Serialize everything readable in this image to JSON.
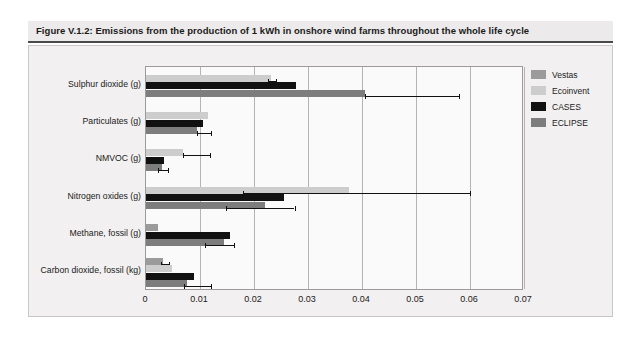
{
  "figure": {
    "caption": "Figure V.1.2: Emissions from the production of 1 kWh in onshore wind farms throughout the whole life cycle"
  },
  "legend": {
    "position": "top-right",
    "entries": [
      {
        "label": "Vestas",
        "color": "#9b9b9b"
      },
      {
        "label": "Ecoinvent",
        "color": "#cdcdcd"
      },
      {
        "label": "CASES",
        "color": "#111111"
      },
      {
        "label": "ECLIPSE",
        "color": "#7d7d7d"
      }
    ]
  },
  "chart_data": {
    "type": "bar",
    "orientation": "horizontal",
    "title": "Emissions from the production of 1 kWh in onshore wind farms throughout the whole life cycle",
    "xlabel": "",
    "ylabel": "",
    "xlim": [
      0,
      0.07
    ],
    "xticks": [
      "0",
      "0.01",
      "0.02",
      "0.03",
      "0.04",
      "0.05",
      "0.06",
      "0.07"
    ],
    "xtick_values": [
      0,
      0.01,
      0.02,
      0.03,
      0.04,
      0.05,
      0.06,
      0.07
    ],
    "grid": "vertical",
    "categories": [
      "Sulphur dioxide (g)",
      "Particulates (g)",
      "NMVOC (g)",
      "Nitrogen oxides (g)",
      "Methane, fossil (g)",
      "Carbon dioxide, fossil (kg)"
    ],
    "series": [
      {
        "name": "Vestas",
        "color": "#9b9b9b",
        "values": [
          null,
          null,
          null,
          null,
          0.0022,
          0.0032
        ]
      },
      {
        "name": "Ecoinvent",
        "color": "#cdcdcd",
        "values": [
          0.0232,
          0.0115,
          0.0068,
          0.0375,
          null,
          0.0048
        ]
      },
      {
        "name": "CASES",
        "color": "#111111",
        "values": [
          0.0277,
          0.0105,
          0.0034,
          0.0255,
          0.0155,
          0.0088
        ]
      },
      {
        "name": "ECLIPSE",
        "color": "#7d7d7d",
        "values": [
          0.0405,
          0.0095,
          0.003,
          0.022,
          0.0145,
          0.0075
        ]
      }
    ],
    "error_bars": [
      {
        "category": "Sulphur dioxide (g)",
        "series": "Ecoinvent",
        "center": 0.0232,
        "low": 0.0225,
        "high": 0.024
      },
      {
        "category": "Sulphur dioxide (g)",
        "series": "ECLIPSE",
        "center": 0.0405,
        "low": 0.0405,
        "high": 0.058
      },
      {
        "category": "Particulates (g)",
        "series": "ECLIPSE",
        "center": 0.0095,
        "low": 0.0095,
        "high": 0.012
      },
      {
        "category": "NMVOC (g)",
        "series": "Ecoinvent",
        "center": 0.0068,
        "low": 0.0068,
        "high": 0.0118
      },
      {
        "category": "NMVOC (g)",
        "series": "ECLIPSE",
        "center": 0.003,
        "low": 0.0022,
        "high": 0.004
      },
      {
        "category": "Nitrogen oxides (g)",
        "series": "Ecoinvent",
        "center": 0.0375,
        "low": 0.018,
        "high": 0.06
      },
      {
        "category": "Nitrogen oxides (g)",
        "series": "ECLIPSE",
        "center": 0.022,
        "low": 0.0148,
        "high": 0.0275
      },
      {
        "category": "Methane, fossil (g)",
        "series": "ECLIPSE",
        "center": 0.0145,
        "low": 0.011,
        "high": 0.0163
      },
      {
        "category": "Carbon dioxide, fossil (kg)",
        "series": "Vestas",
        "center": 0.0032,
        "low": 0.0028,
        "high": 0.0043
      },
      {
        "category": "Carbon dioxide, fossil (kg)",
        "series": "ECLIPSE",
        "center": 0.0075,
        "low": 0.007,
        "high": 0.012
      }
    ]
  }
}
